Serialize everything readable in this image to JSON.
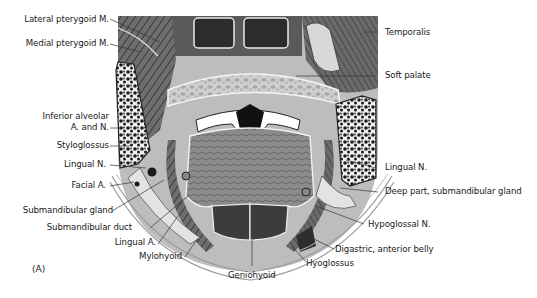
{
  "figure": {
    "panel_label": "(A)"
  },
  "labels": {
    "left": [
      {
        "id": "lateral-pterygoid",
        "text": "Lateral pterygoid M."
      },
      {
        "id": "medial-pterygoid",
        "text": "Medial pterygoid M."
      },
      {
        "id": "inferior-alveolar-1",
        "text": "Inferior alveolar"
      },
      {
        "id": "inferior-alveolar-2",
        "text": "A. and N."
      },
      {
        "id": "styloglossus",
        "text": "Styloglossus"
      },
      {
        "id": "lingual-n-left",
        "text": "Lingual N."
      },
      {
        "id": "facial-a",
        "text": "Facial A."
      },
      {
        "id": "submandibular-gland",
        "text": "Submandibular gland"
      },
      {
        "id": "submandibular-duct",
        "text": "Submandibular duct"
      },
      {
        "id": "lingual-a",
        "text": "Lingual A."
      },
      {
        "id": "mylohyoid",
        "text": "Mylohyoid"
      }
    ],
    "right": [
      {
        "id": "temporalis",
        "text": "Temporalis"
      },
      {
        "id": "soft-palate",
        "text": "Soft palate"
      },
      {
        "id": "lingual-n-right",
        "text": "Lingual N."
      },
      {
        "id": "deep-part-submandibular",
        "text": "Deep part, submandibular gland"
      },
      {
        "id": "hypoglossal-n",
        "text": "Hypoglossal N."
      },
      {
        "id": "digastric",
        "text": "Digastric, anterior belly"
      },
      {
        "id": "hyoglossus",
        "text": "Hyoglossus"
      }
    ],
    "bottom": [
      {
        "id": "geniohyoid",
        "text": "Geniohyoid"
      }
    ]
  },
  "colors": {
    "background": "#ffffff",
    "text": "#1a1a1a",
    "leader": "#333333",
    "muscle_dark": "#4a4a4a",
    "muscle_mid": "#7c7c7c",
    "tissue_light": "#c9c9c9",
    "gland": "#e2e2e2",
    "bone_marrow": "#1c1c1c"
  }
}
